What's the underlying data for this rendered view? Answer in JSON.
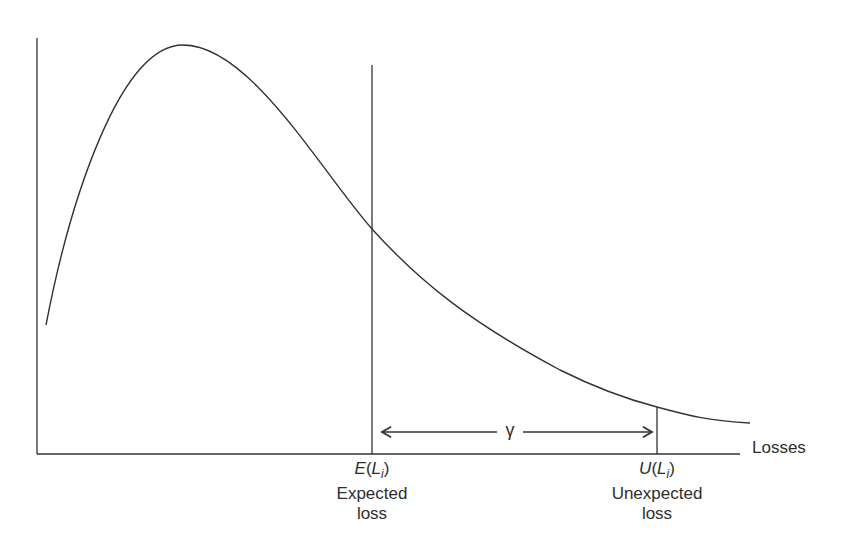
{
  "diagram": {
    "type": "loss-distribution",
    "x_axis_label": "Losses",
    "gamma_symbol": "γ",
    "markers": [
      {
        "id": "expected",
        "math_func": "E",
        "math_var": "L",
        "math_sub": "i",
        "line1": "Expected",
        "line2": "loss"
      },
      {
        "id": "unexpected",
        "math_func": "U",
        "math_var": "L",
        "math_sub": "i",
        "line1": "Unexpected",
        "line2": "loss"
      }
    ],
    "stroke_color": "#333333"
  }
}
